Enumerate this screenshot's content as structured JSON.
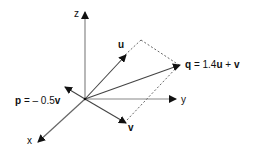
{
  "diagram": {
    "type": "3d-vector-diagram",
    "axes": {
      "x_label": "x",
      "y_label": "y",
      "z_label": "z"
    },
    "vectors": {
      "u": {
        "label": "u"
      },
      "v": {
        "label": "v"
      },
      "q": {
        "name": "q",
        "expr": " = 1.4",
        "u": "u",
        "plus": " + ",
        "v": "v"
      },
      "p": {
        "name": "p",
        "expr": " = – 0.5",
        "v": "v"
      }
    },
    "colors": {
      "axis": "#888888",
      "vector": "#444444",
      "arrowhead": "#111111",
      "dashed": "#555555"
    }
  }
}
